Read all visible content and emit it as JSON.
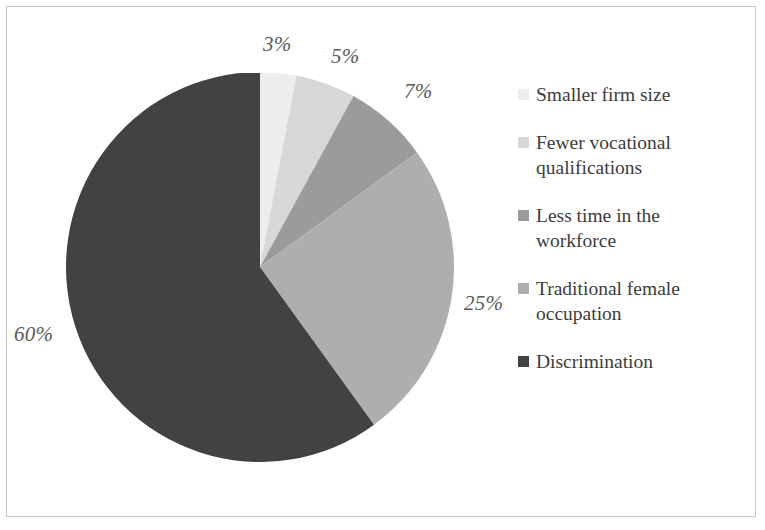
{
  "chart_data": {
    "type": "pie",
    "title": "",
    "subtitle": "",
    "xlabel": "",
    "ylabel": "",
    "legend_position": "right",
    "grid": false,
    "start_angle_deg": 0,
    "direction": "clockwise",
    "categories": [
      "Smaller firm size",
      "Fewer vocational qualifications",
      "Less time in the workforce",
      "Traditional female occupation",
      "Discrimination"
    ],
    "values": [
      3,
      5,
      7,
      25,
      60
    ],
    "value_labels": [
      "3%",
      "5%",
      "7%",
      "25%",
      "60%"
    ],
    "colors": [
      "#ededed",
      "#d8d8d8",
      "#9b9b9b",
      "#aeaeae",
      "#424242"
    ],
    "units": "percent"
  },
  "pie": {
    "slices": [
      {
        "label": "Smaller firm size",
        "value": 3,
        "display": "3%",
        "color": "#ededed"
      },
      {
        "label": "Fewer vocational qualifications",
        "value": 5,
        "display": "5%",
        "color": "#d8d8d8"
      },
      {
        "label": "Less time in the workforce",
        "value": 7,
        "display": "7%",
        "color": "#9b9b9b"
      },
      {
        "label": "Traditional female occupation",
        "value": 25,
        "display": "25%",
        "color": "#aeaeae"
      },
      {
        "label": "Discrimination",
        "value": 60,
        "display": "60%",
        "color": "#424242"
      }
    ],
    "labels": {
      "p3": "3%",
      "p5": "5%",
      "p7": "7%",
      "p25": "25%",
      "p60": "60%"
    }
  },
  "legend": {
    "items": [
      {
        "label": "Smaller firm size",
        "color": "#ededed"
      },
      {
        "label": "Fewer vocational qualifications",
        "color": "#d8d8d8"
      },
      {
        "label": "Less time in the workforce",
        "color": "#9b9b9b"
      },
      {
        "label": "Traditional female occupation",
        "color": "#aeaeae"
      },
      {
        "label": "Discrimination",
        "color": "#424242"
      }
    ]
  }
}
